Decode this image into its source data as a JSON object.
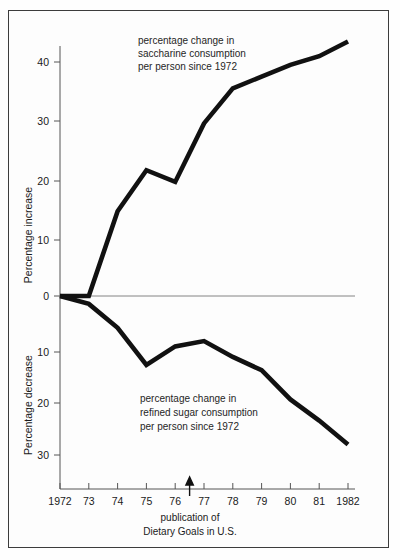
{
  "figure": {
    "background_color": "#fdfdfd",
    "frame_color": "#3c3c3c",
    "line_color": "#111111"
  },
  "chart_data": {
    "type": "line",
    "title": "",
    "subtitle": "",
    "xlabel": "",
    "grid": false,
    "legend_position": "inline-annotations",
    "x": [
      1972,
      1973,
      1974,
      1975,
      1976,
      1977,
      1978,
      1979,
      1980,
      1981,
      1982
    ],
    "categories": [
      "1972",
      "73",
      "74",
      "75",
      "76",
      "77",
      "78",
      "79",
      "80",
      "81",
      "1982"
    ],
    "series": [
      {
        "name": "percentage change in saccharine consumption per person since 1972",
        "axis": "upper",
        "direction": "increase",
        "values": [
          0,
          0,
          14.5,
          21.5,
          19.5,
          29.5,
          35.5,
          37.5,
          39.5,
          41,
          43.5
        ]
      },
      {
        "name": "percentage change in refined sugar consumption per person since 1972",
        "axis": "lower",
        "direction": "decrease",
        "values": [
          0,
          1.5,
          6,
          13,
          9.5,
          8.5,
          11.5,
          14,
          19.5,
          23.5,
          28
        ]
      }
    ],
    "upper_axis": {
      "ylabel": "Percentage increase",
      "ticks": [
        0,
        10,
        20,
        30,
        40
      ],
      "tick_labels": [
        "0",
        "10",
        "20",
        "30",
        "40"
      ],
      "ylim": [
        0,
        45
      ]
    },
    "lower_axis": {
      "ylabel": "Percentage decrease",
      "ticks": [
        0,
        10,
        20,
        30
      ],
      "tick_labels": [
        "0",
        "10",
        "20",
        "30"
      ],
      "ylim": [
        0,
        34
      ]
    },
    "annotations": [
      {
        "name": "saccharine-annotation",
        "lines": [
          "percentage change in",
          "saccharine consumption",
          "per person since 1972"
        ]
      },
      {
        "name": "refined-sugar-annotation",
        "lines": [
          "percentage change in",
          "refined sugar consumption",
          "per person since 1972"
        ]
      },
      {
        "name": "publication-marker",
        "marker": "up-arrow",
        "at_x": 1976.5,
        "lines": [
          "publication of",
          "Dietary Goals in U.S."
        ]
      }
    ]
  },
  "labels": {
    "upper_y_title": "Percentage increase",
    "lower_y_title": "Percentage decrease",
    "upper_ticks": [
      "40",
      "30",
      "20",
      "10",
      "0"
    ],
    "lower_ticks": [
      "0",
      "10",
      "20",
      "30"
    ],
    "x_ticks": [
      "1972",
      "73",
      "74",
      "75",
      "76",
      "77",
      "78",
      "79",
      "80",
      "81",
      "1982"
    ],
    "saccharine_note_l1": "percentage change in",
    "saccharine_note_l2": "saccharine consumption",
    "saccharine_note_l3": "per person since 1972",
    "sugar_note_l1": "percentage change in",
    "sugar_note_l2": "refined sugar consumption",
    "sugar_note_l3": "per person since 1972",
    "publication_l1": "publication of",
    "publication_l2": "Dietary Goals in U.S."
  }
}
